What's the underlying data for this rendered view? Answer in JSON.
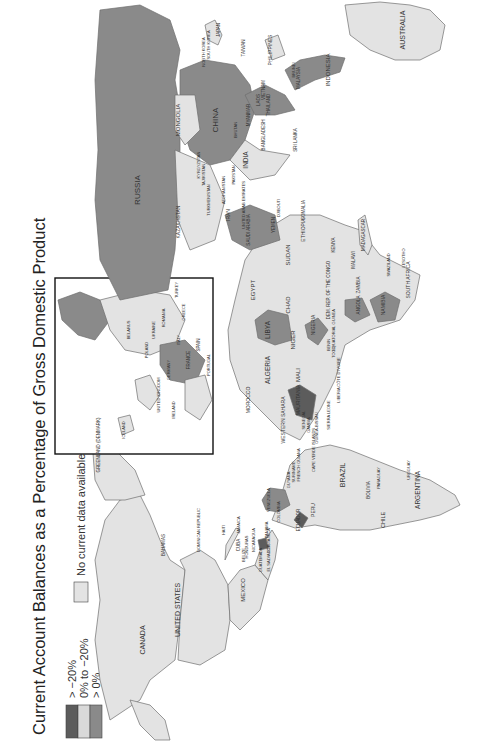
{
  "title": "Current Account Balances as a Percentage of Gross Domestic Product",
  "orientation": "rotated 90° counter-clockwise (read bottom-to-top)",
  "colors": {
    "deficit_over_20": "#5c5c5c",
    "deficit_0_to_20": "#d9d9d9",
    "surplus": "#8a8a8a",
    "no_data": "#e3e3e3",
    "ocean": "#ffffff",
    "border": "#6f6f6f"
  },
  "legend": {
    "items": [
      {
        "label": "> −20%",
        "color_key": "deficit_over_20"
      },
      {
        "label": "0% to −20%",
        "color_key": "deficit_0_to_20"
      },
      {
        "label": "> 0%",
        "color_key": "surplus"
      }
    ],
    "no_data_label": "No current data available"
  },
  "inset": {
    "label": "Europe inset"
  },
  "countries": [
    {
      "name": "RUSSIA",
      "x": 140,
      "y": 190,
      "size": 8
    },
    {
      "name": "CHINA",
      "x": 218,
      "y": 120,
      "size": 8
    },
    {
      "name": "MONGOLIA",
      "x": 180,
      "y": 120,
      "size": 6
    },
    {
      "name": "KAZAKHSTAN",
      "x": 180,
      "y": 222,
      "size": 5
    },
    {
      "name": "INDIA",
      "x": 248,
      "y": 160,
      "size": 6.5
    },
    {
      "name": "SRI LANKA",
      "x": 297,
      "y": 140,
      "size": 4.5
    },
    {
      "name": "BANGLADESH",
      "x": 265,
      "y": 135,
      "size": 4.5
    },
    {
      "name": "MYANMAR",
      "x": 250,
      "y": 115,
      "size": 4.5
    },
    {
      "name": "THAILAND",
      "x": 270,
      "y": 105,
      "size": 4.5
    },
    {
      "name": "VIETNAM",
      "x": 265,
      "y": 90,
      "size": 4.5
    },
    {
      "name": "LAOS",
      "x": 260,
      "y": 100,
      "size": 4.5
    },
    {
      "name": "MALAYSIA",
      "x": 300,
      "y": 78,
      "size": 4.5
    },
    {
      "name": "BRUNEI",
      "x": 295,
      "y": 70,
      "size": 4
    },
    {
      "name": "INDONESIA",
      "x": 330,
      "y": 70,
      "size": 6
    },
    {
      "name": "PHILIPPINES",
      "x": 272,
      "y": 50,
      "size": 5
    },
    {
      "name": "TAIWAN",
      "x": 245,
      "y": 48,
      "size": 4.5
    },
    {
      "name": "JAPAN",
      "x": 220,
      "y": 30,
      "size": 4.5
    },
    {
      "name": "NORTH KOREA",
      "x": 205,
      "y": 52,
      "size": 4
    },
    {
      "name": "SOUTH KOREA",
      "x": 210,
      "y": 45,
      "size": 4
    },
    {
      "name": "AUSTRALIA",
      "x": 405,
      "y": 30,
      "size": 7
    },
    {
      "name": "MADAGASCAR",
      "x": 365,
      "y": 235,
      "size": 4.5
    },
    {
      "name": "MALAWI",
      "x": 355,
      "y": 260,
      "size": 4.5
    },
    {
      "name": "SOUTH AFRICA",
      "x": 410,
      "y": 280,
      "size": 5
    },
    {
      "name": "LESOTHO",
      "x": 405,
      "y": 258,
      "size": 4
    },
    {
      "name": "SWAZILAND",
      "x": 390,
      "y": 265,
      "size": 4
    },
    {
      "name": "NAMIBIA",
      "x": 385,
      "y": 305,
      "size": 5
    },
    {
      "name": "ANGOLA",
      "x": 360,
      "y": 305,
      "size": 4.5
    },
    {
      "name": "ZAMBIA",
      "x": 360,
      "y": 285,
      "size": 4.5
    },
    {
      "name": "DEM. REP. OF THE CONGO",
      "x": 330,
      "y": 290,
      "size": 4.5
    },
    {
      "name": "SUDAN",
      "x": 290,
      "y": 255,
      "size": 6
    },
    {
      "name": "CHAD",
      "x": 290,
      "y": 305,
      "size": 6
    },
    {
      "name": "ETHIOPIA",
      "x": 305,
      "y": 230,
      "size": 5
    },
    {
      "name": "SOMALIA",
      "x": 305,
      "y": 210,
      "size": 4.5
    },
    {
      "name": "KENYA",
      "x": 335,
      "y": 245,
      "size": 4.5
    },
    {
      "name": "EGYPT",
      "x": 255,
      "y": 290,
      "size": 6
    },
    {
      "name": "LIBYA",
      "x": 270,
      "y": 330,
      "size": 6.5
    },
    {
      "name": "NIGER",
      "x": 295,
      "y": 340,
      "size": 6
    },
    {
      "name": "NIGERIA",
      "x": 315,
      "y": 325,
      "size": 5
    },
    {
      "name": "ALGERIA",
      "x": 270,
      "y": 370,
      "size": 6.5
    },
    {
      "name": "MALI",
      "x": 300,
      "y": 375,
      "size": 6
    },
    {
      "name": "MAURITANIA",
      "x": 300,
      "y": 400,
      "size": 5
    },
    {
      "name": "MOROCCO",
      "x": 250,
      "y": 400,
      "size": 5
    },
    {
      "name": "WESTERN SAHARA",
      "x": 285,
      "y": 420,
      "size": 5
    },
    {
      "name": "SENEGAL",
      "x": 305,
      "y": 420,
      "size": 4
    },
    {
      "name": "GAMBIA",
      "x": 310,
      "y": 425,
      "size": 4
    },
    {
      "name": "GUINEA-BISSAU",
      "x": 318,
      "y": 428,
      "size": 4
    },
    {
      "name": "SIERRA LEONE",
      "x": 330,
      "y": 415,
      "size": 4
    },
    {
      "name": "LIBERIA",
      "x": 340,
      "y": 395,
      "size": 4
    },
    {
      "name": "CÔTE D'IVOIRE",
      "x": 340,
      "y": 372,
      "size": 4
    },
    {
      "name": "TOGO",
      "x": 335,
      "y": 352,
      "size": 4
    },
    {
      "name": "BENIN",
      "x": 330,
      "y": 345,
      "size": 4
    },
    {
      "name": "EQUATORIAL GUINEA",
      "x": 335,
      "y": 330,
      "size": 4
    },
    {
      "name": "CAPE VERDE ISLANDS",
      "x": 315,
      "y": 450,
      "size": 4
    },
    {
      "name": "SAUDI ARABIA",
      "x": 250,
      "y": 230,
      "size": 4.5
    },
    {
      "name": "UNITED ARAB EMIRATES",
      "x": 245,
      "y": 205,
      "size": 4
    },
    {
      "name": "YEMEN",
      "x": 275,
      "y": 225,
      "size": 4.5
    },
    {
      "name": "DJIBOUTI",
      "x": 280,
      "y": 208,
      "size": 4
    },
    {
      "name": "IRAN",
      "x": 230,
      "y": 215,
      "size": 5
    },
    {
      "name": "TURKMENISTAN",
      "x": 210,
      "y": 200,
      "size": 4
    },
    {
      "name": "AFGHANISTAN",
      "x": 225,
      "y": 190,
      "size": 4
    },
    {
      "name": "PAKISTAN",
      "x": 235,
      "y": 175,
      "size": 4
    },
    {
      "name": "KYRGYZSTAN",
      "x": 200,
      "y": 165,
      "size": 4
    },
    {
      "name": "TAJIKISTAN",
      "x": 205,
      "y": 175,
      "size": 4
    },
    {
      "name": "BHUTAN",
      "x": 237,
      "y": 130,
      "size": 4
    },
    {
      "name": "GREENLAND (DENMARK)",
      "x": 100,
      "y": 445,
      "size": 4.5
    },
    {
      "name": "CANADA",
      "x": 145,
      "y": 640,
      "size": 7
    },
    {
      "name": "UNITED STATES",
      "x": 180,
      "y": 610,
      "size": 7
    },
    {
      "name": "MEXICO",
      "x": 245,
      "y": 590,
      "size": 6
    },
    {
      "name": "BAHAMAS",
      "x": 165,
      "y": 545,
      "size": 4.5
    },
    {
      "name": "CUBA",
      "x": 240,
      "y": 545,
      "size": 4.5
    },
    {
      "name": "DOMINICAN REPUBLIC",
      "x": 200,
      "y": 530,
      "size": 4
    },
    {
      "name": "HAITI",
      "x": 225,
      "y": 530,
      "size": 4
    },
    {
      "name": "JAMAICA",
      "x": 240,
      "y": 525,
      "size": 4
    },
    {
      "name": "BELIZE",
      "x": 245,
      "y": 555,
      "size": 4
    },
    {
      "name": "HONDURAS",
      "x": 248,
      "y": 547,
      "size": 4
    },
    {
      "name": "NICARAGUA",
      "x": 255,
      "y": 540,
      "size": 4
    },
    {
      "name": "GUATEMALA",
      "x": 262,
      "y": 560,
      "size": 4
    },
    {
      "name": "EL SALVADOR",
      "x": 270,
      "y": 558,
      "size": 4
    },
    {
      "name": "COSTA RICA",
      "x": 270,
      "y": 540,
      "size": 4
    },
    {
      "name": "PANAMA",
      "x": 268,
      "y": 530,
      "size": 4
    },
    {
      "name": "COLOMBIA",
      "x": 280,
      "y": 512,
      "size": 4
    },
    {
      "name": "VENEZUELA",
      "x": 270,
      "y": 500,
      "size": 4
    },
    {
      "name": "ECUADOR",
      "x": 300,
      "y": 520,
      "size": 4.5
    },
    {
      "name": "PERU",
      "x": 315,
      "y": 510,
      "size": 5
    },
    {
      "name": "GUYANA",
      "x": 290,
      "y": 480,
      "size": 4
    },
    {
      "name": "SURINAME",
      "x": 295,
      "y": 472,
      "size": 4
    },
    {
      "name": "FRENCH GUIANA",
      "x": 300,
      "y": 465,
      "size": 4
    },
    {
      "name": "BRAZIL",
      "x": 345,
      "y": 475,
      "size": 7
    },
    {
      "name": "BOLIVIA",
      "x": 370,
      "y": 490,
      "size": 4.5
    },
    {
      "name": "PARAGUAY",
      "x": 380,
      "y": 478,
      "size": 4
    },
    {
      "name": "URUGUAY",
      "x": 410,
      "y": 470,
      "size": 4
    },
    {
      "name": "ARGENTINA",
      "x": 420,
      "y": 490,
      "size": 6.5
    },
    {
      "name": "CHILE",
      "x": 385,
      "y": 520,
      "size": 5.5
    },
    {
      "name": "SPAIN",
      "x": 200,
      "y": 345,
      "size": 4.5
    },
    {
      "name": "PORTUGAL",
      "x": 210,
      "y": 365,
      "size": 4
    },
    {
      "name": "FRANCE",
      "x": 190,
      "y": 360,
      "size": 4.5
    },
    {
      "name": "UNITED KINGDOM",
      "x": 160,
      "y": 395,
      "size": 4
    },
    {
      "name": "IRELAND",
      "x": 175,
      "y": 410,
      "size": 4
    },
    {
      "name": "ICELAND",
      "x": 125,
      "y": 430,
      "size": 4
    },
    {
      "name": "GERMANY",
      "x": 170,
      "y": 370,
      "size": 4
    },
    {
      "name": "POLAND",
      "x": 148,
      "y": 350,
      "size": 4
    },
    {
      "name": "UKRAINE",
      "x": 155,
      "y": 330,
      "size": 4
    },
    {
      "name": "BELARUS",
      "x": 130,
      "y": 330,
      "size": 4
    },
    {
      "name": "TURKEY",
      "x": 178,
      "y": 290,
      "size": 4
    },
    {
      "name": "ITALY",
      "x": 180,
      "y": 340,
      "size": 4
    },
    {
      "name": "GREECE",
      "x": 185,
      "y": 312,
      "size": 4
    },
    {
      "name": "ROMANIA",
      "x": 165,
      "y": 318,
      "size": 4
    }
  ],
  "shapes": {
    "russia": {
      "fill_key": "surplus"
    },
    "china": {
      "fill_key": "surplus"
    },
    "libya": {
      "fill_key": "surplus"
    },
    "mauritania": {
      "fill_key": "deficit_over_20"
    },
    "nigeria": {
      "fill_key": "surplus"
    },
    "namibia": {
      "fill_key": "surplus"
    },
    "venezuela": {
      "fill_key": "surplus"
    },
    "ecuador": {
      "fill_key": "deficit_over_20"
    },
    "nicaragua": {
      "fill_key": "deficit_over_20"
    },
    "saudi": {
      "fill_key": "surplus"
    },
    "indonesia": {
      "fill_key": "surplus"
    },
    "malaysia": {
      "fill_key": "surplus"
    },
    "angola": {
      "fill_key": "surplus"
    },
    "france": {
      "fill_key": "surplus"
    },
    "norway": {
      "fill_key": "surplus"
    }
  }
}
